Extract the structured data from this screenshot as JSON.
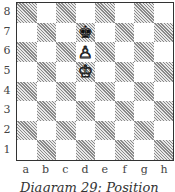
{
  "diagram": {
    "caption": "Diagram 29: Position",
    "ranks": [
      "8",
      "7",
      "6",
      "5",
      "4",
      "3",
      "2",
      "1"
    ],
    "files": [
      "a",
      "b",
      "c",
      "d",
      "e",
      "f",
      "g",
      "h"
    ],
    "colors": {
      "dark_hatch": "#8a8a8a",
      "light": "#ffffff",
      "border": "#333333"
    },
    "pieces": [
      {
        "square": "d7",
        "piece": "king",
        "color": "black",
        "glyph": "♚"
      },
      {
        "square": "d6",
        "piece": "pawn",
        "color": "white",
        "glyph": "♙"
      },
      {
        "square": "d5",
        "piece": "king",
        "color": "white",
        "glyph": "♔"
      }
    ]
  }
}
